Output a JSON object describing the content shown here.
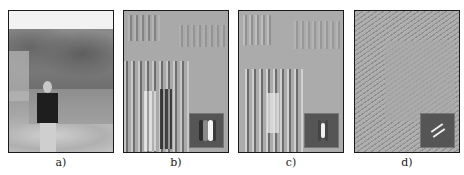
{
  "figure": {
    "panels": [
      {
        "id": "a",
        "label": "a)",
        "content": "grayscale photograph of a person standing on rocks by a lake with trees",
        "has_inset": false
      },
      {
        "id": "b",
        "label": "b)",
        "content": "Gabor filter response, vertical orientation",
        "has_inset": true,
        "inset": "vertical Gabor kernel (dark-bright-dark bands)"
      },
      {
        "id": "c",
        "label": "c)",
        "content": "Gabor filter response, vertical orientation, alternate phase",
        "has_inset": true,
        "inset": "vertical Gabor kernel (single bright band)"
      },
      {
        "id": "d",
        "label": "d)",
        "content": "Gabor filter response, diagonal orientation",
        "has_inset": true,
        "inset": "diagonal Gabor kernel"
      }
    ]
  },
  "colors": {
    "border": "#1a1a1a",
    "background": "#ffffff",
    "inset_bg": "#555555"
  }
}
